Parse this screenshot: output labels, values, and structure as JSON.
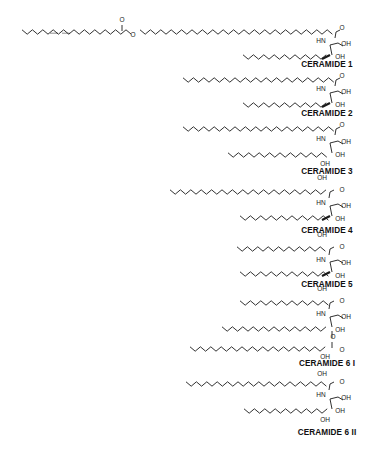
{
  "figure": {
    "background": "#ffffff",
    "ink_color": "#1a1a1a"
  },
  "structures": [
    {
      "id": "ceramide-1",
      "label": "CERAMIDE 1",
      "label_pos": [
        327,
        67
      ],
      "chains": [
        {
          "role": "linoleic-ester-chain",
          "x0": 22,
          "x1": 132,
          "y": 32,
          "amp": 2.2,
          "unsat": [
            [
              50,
              58
            ],
            [
              62,
              70
            ]
          ]
        },
        {
          "role": "omega-hydroxy-acyl-chain",
          "x0": 140,
          "x1": 336,
          "y": 32,
          "amp": 2.2
        },
        {
          "role": "sphingoid-chain",
          "x0": 243,
          "x1": 330,
          "y": 57,
          "amp": 2.2,
          "trans_db": [
            322,
            330
          ]
        }
      ],
      "atoms": [
        {
          "t": "O",
          "x": 122,
          "y": 22
        },
        {
          "t": "O",
          "x": 133,
          "y": 37
        },
        {
          "t": "O",
          "x": 342,
          "y": 30
        },
        {
          "t": "HN",
          "x": 321,
          "y": 43
        },
        {
          "t": "OH",
          "x": 346,
          "y": 46
        },
        {
          "t": "OH",
          "x": 340,
          "y": 59
        }
      ]
    },
    {
      "id": "ceramide-2",
      "label": "CERAMIDE 2",
      "label_pos": [
        327,
        116
      ],
      "chains": [
        {
          "role": "acyl-chain",
          "x0": 183,
          "x1": 336,
          "y": 80,
          "amp": 2.2
        },
        {
          "role": "sphingoid-chain",
          "x0": 243,
          "x1": 330,
          "y": 105,
          "amp": 2.2,
          "trans_db": [
            322,
            330
          ]
        }
      ],
      "atoms": [
        {
          "t": "O",
          "x": 342,
          "y": 78
        },
        {
          "t": "HN",
          "x": 321,
          "y": 91
        },
        {
          "t": "OH",
          "x": 346,
          "y": 94
        },
        {
          "t": "OH",
          "x": 340,
          "y": 107
        }
      ]
    },
    {
      "id": "ceramide-3",
      "label": "CERAMIDE 3",
      "label_pos": [
        327,
        174
      ],
      "chains": [
        {
          "role": "acyl-chain",
          "x0": 183,
          "x1": 336,
          "y": 129,
          "amp": 2.2
        },
        {
          "role": "phytosphingosine-chain",
          "x0": 228,
          "x1": 330,
          "y": 155,
          "amp": 2.2
        }
      ],
      "atoms": [
        {
          "t": "O",
          "x": 342,
          "y": 127
        },
        {
          "t": "HN",
          "x": 321,
          "y": 141
        },
        {
          "t": "OH",
          "x": 346,
          "y": 144
        },
        {
          "t": "OH",
          "x": 340,
          "y": 157
        },
        {
          "t": "OH",
          "x": 325,
          "y": 166
        }
      ]
    },
    {
      "id": "ceramide-4",
      "label": "CERAMIDE 4",
      "label_pos": [
        327,
        233
      ],
      "chains": [
        {
          "role": "alpha-hydroxy-acyl-chain",
          "x0": 170,
          "x1": 330,
          "y": 192,
          "amp": 2.2
        },
        {
          "role": "sphingoid-chain",
          "x0": 240,
          "x1": 330,
          "y": 218,
          "amp": 2.2,
          "trans_db": [
            322,
            330
          ]
        }
      ],
      "atoms": [
        {
          "t": "OH",
          "x": 322,
          "y": 180
        },
        {
          "t": "O",
          "x": 342,
          "y": 192
        },
        {
          "t": "HN",
          "x": 321,
          "y": 205
        },
        {
          "t": "OH",
          "x": 346,
          "y": 208
        },
        {
          "t": "OH",
          "x": 340,
          "y": 221
        }
      ]
    },
    {
      "id": "ceramide-5",
      "label": "CERAMIDE 5",
      "label_pos": [
        327,
        287
      ],
      "chains": [
        {
          "role": "alpha-hydroxy-acyl-chain",
          "x0": 237,
          "x1": 330,
          "y": 249,
          "amp": 2.2
        },
        {
          "role": "sphingoid-chain",
          "x0": 240,
          "x1": 330,
          "y": 274,
          "amp": 2.2,
          "trans_db": [
            322,
            330
          ]
        }
      ],
      "atoms": [
        {
          "t": "OH",
          "x": 322,
          "y": 237
        },
        {
          "t": "O",
          "x": 342,
          "y": 249
        },
        {
          "t": "HN",
          "x": 321,
          "y": 262
        },
        {
          "t": "OH",
          "x": 346,
          "y": 265
        },
        {
          "t": "OH",
          "x": 340,
          "y": 278
        }
      ]
    },
    {
      "id": "ceramide-6-i",
      "label": "CERAMIDE 6 I",
      "label_pos": [
        327,
        366
      ],
      "chains": [
        {
          "role": "alpha-hydroxy-acyl-chain",
          "x0": 240,
          "x1": 330,
          "y": 303,
          "amp": 2.2
        },
        {
          "role": "sphingoid-chain",
          "x0": 222,
          "x1": 330,
          "y": 329,
          "amp": 2.2
        },
        {
          "role": "esterified-hydroxy-acyl-chain",
          "x0": 190,
          "x1": 330,
          "y": 349,
          "amp": 2.2
        }
      ],
      "atoms": [
        {
          "t": "OH",
          "x": 322,
          "y": 291
        },
        {
          "t": "O",
          "x": 342,
          "y": 303
        },
        {
          "t": "HN",
          "x": 321,
          "y": 316
        },
        {
          "t": "OH",
          "x": 346,
          "y": 319
        },
        {
          "t": "OH",
          "x": 340,
          "y": 332
        },
        {
          "t": "O",
          "x": 333,
          "y": 339
        },
        {
          "t": "O",
          "x": 342,
          "y": 352
        },
        {
          "t": "OH",
          "x": 325,
          "y": 359
        }
      ]
    },
    {
      "id": "ceramide-6-ii",
      "label": "CERAMIDE 6 II",
      "label_pos": [
        327,
        435
      ],
      "chains": [
        {
          "role": "alpha-hydroxy-acyl-chain",
          "x0": 186,
          "x1": 330,
          "y": 384,
          "amp": 2.2
        },
        {
          "role": "phytosphingosine-chain",
          "x0": 244,
          "x1": 330,
          "y": 411,
          "amp": 2.2
        }
      ],
      "atoms": [
        {
          "t": "OH",
          "x": 322,
          "y": 376
        },
        {
          "t": "O",
          "x": 342,
          "y": 384
        },
        {
          "t": "HN",
          "x": 321,
          "y": 397
        },
        {
          "t": "OH",
          "x": 346,
          "y": 400
        },
        {
          "t": "OH",
          "x": 340,
          "y": 413
        },
        {
          "t": "OH",
          "x": 325,
          "y": 422
        }
      ]
    }
  ]
}
